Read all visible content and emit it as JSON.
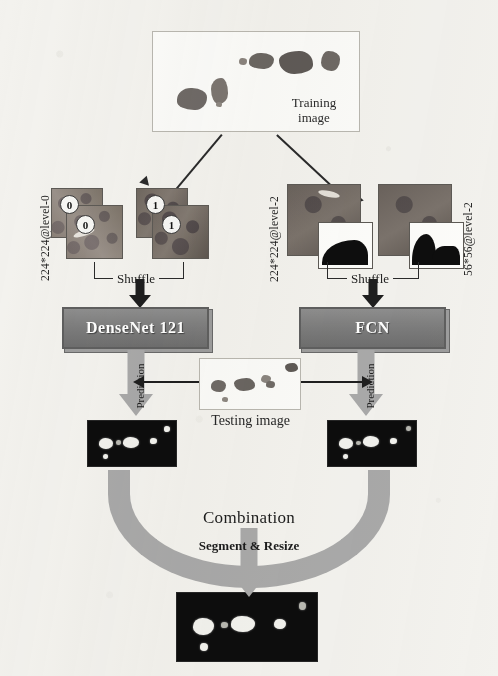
{
  "figure": {
    "background_color": "#f3f2ee"
  },
  "training": {
    "label_line1": "Training",
    "label_line2": "image",
    "panel_name": "training-image-panel"
  },
  "branches": [
    {
      "id": "classification",
      "size_label": "224*224@level-0",
      "patch_labels": [
        "0",
        "0",
        "1",
        "1"
      ],
      "shuffle_label": "Shuffle",
      "model_label": "DenseNet 121",
      "prediction_label": "Prediction"
    },
    {
      "id": "segmentation",
      "size_label_left": "224*224@level-2",
      "size_label_right": "56*56@level-2",
      "shuffle_label": "Shuffle",
      "model_label": "FCN",
      "prediction_label": "Prediction"
    }
  ],
  "testing": {
    "label": "Testing image"
  },
  "combination": {
    "arc_label": "Combination",
    "arrow_label": "Segment & Resize"
  },
  "output": {
    "name": "final-segmentation-output"
  },
  "colors": {
    "model_box": "#7c7c7c",
    "gray_arrow": "#a9a9a9",
    "black_arrow": "#1e1e1e",
    "dark_panel": "#0d0d0d",
    "light_panel": "#fbfbf9"
  }
}
